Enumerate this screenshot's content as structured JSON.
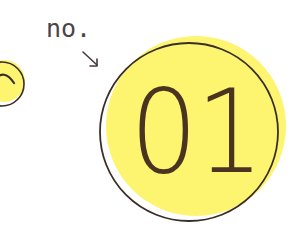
{
  "badge": {
    "prefix_label": "no.",
    "number": "01"
  },
  "colors": {
    "fill_yellow": "#fdf470",
    "outline": "#3a2e28",
    "number_text": "#4a3420",
    "label_text": "#4a4546",
    "background": "#ffffff"
  },
  "icons": {
    "pointer": "arrow-down-right-icon",
    "side_badge": "partial-circle-badge-icon"
  }
}
